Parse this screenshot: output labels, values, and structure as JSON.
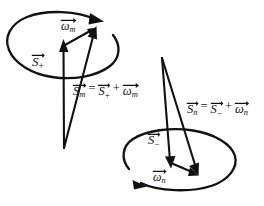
{
  "figure": {
    "background_color": "#ffffff",
    "ink_color": "#111111",
    "width": 264,
    "height": 206
  },
  "labels": {
    "omega_m": {
      "symbol": "ω",
      "subscript": "m",
      "text": "ωm",
      "overarrow": true
    },
    "omega_n": {
      "symbol": "ω",
      "subscript": "n",
      "text": "ωn",
      "overarrow": true
    },
    "s_plus": {
      "symbol": "S",
      "subscript": "+",
      "text": "S+",
      "overarrow": true
    },
    "s_minus": {
      "symbol": "S",
      "subscript": "−",
      "text": "S−",
      "overarrow": true
    },
    "s_m": {
      "symbol": "S",
      "subscript": "m",
      "text": "Sm",
      "overarrow": true
    },
    "s_n": {
      "symbol": "S",
      "subscript": "n",
      "text": "Sn",
      "overarrow": true
    }
  },
  "equations": {
    "upper": {
      "lhs": {
        "symbol": "S",
        "subscript": "m"
      },
      "equals": "=",
      "term1": {
        "symbol": "S",
        "subscript": "+"
      },
      "plus": "+",
      "term2": {
        "symbol": "ω",
        "subscript": "m"
      },
      "plain": "Sm = S+ + ωm"
    },
    "lower": {
      "lhs": {
        "symbol": "S",
        "subscript": "n"
      },
      "equals": "=",
      "term1": {
        "symbol": "S",
        "subscript": "−"
      },
      "plus": "+",
      "term2": {
        "symbol": "ω",
        "subscript": "n"
      },
      "plain": "Sn = S− + ωn"
    }
  },
  "shapes": {
    "upper_circle": {
      "name": "upper-precession-ellipse",
      "cx": 62,
      "cy": 52,
      "rx": 57,
      "ry": 38,
      "circulation": "counterclockwise-viewed-from-above"
    },
    "lower_circle": {
      "name": "lower-precession-ellipse",
      "cx": 182,
      "cy": 160,
      "rx": 56,
      "ry": 33,
      "circulation": "counterclockwise-viewed-from-above"
    }
  }
}
